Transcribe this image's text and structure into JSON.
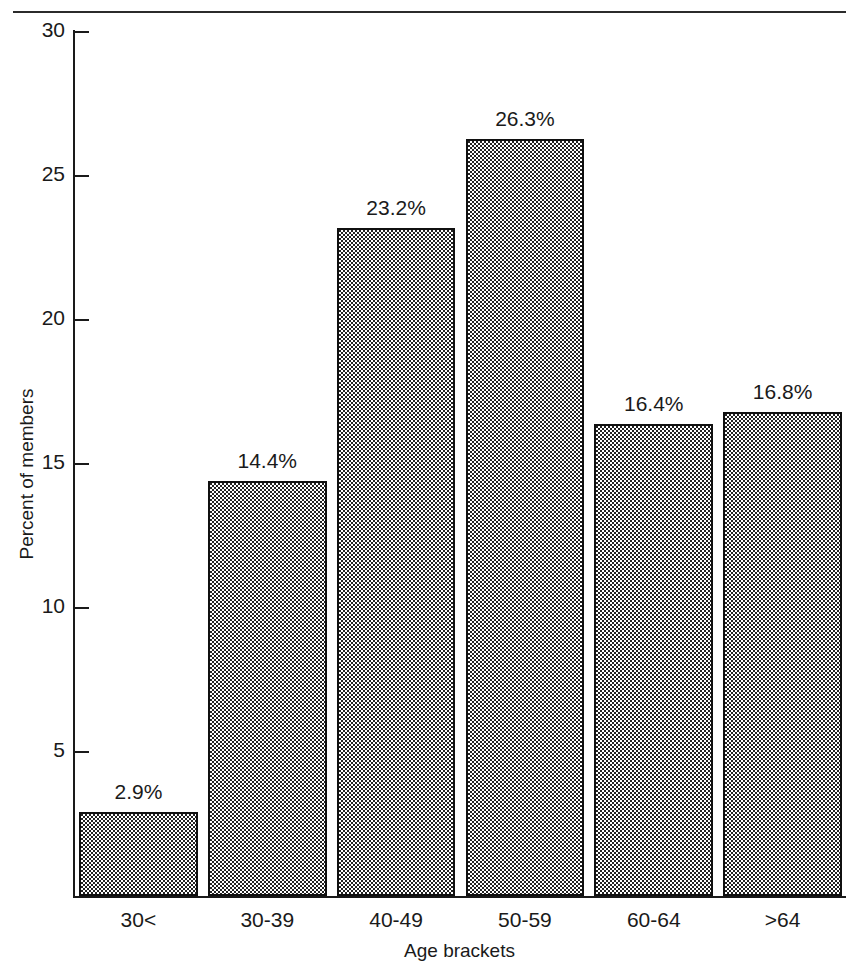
{
  "page": {
    "clipped_caption_above_rule": "",
    "background_color": "#ffffff",
    "ink_color": "#1a1a1a"
  },
  "chart_data": {
    "type": "bar",
    "title": "",
    "xlabel": "Age brackets",
    "ylabel": "Percent of members",
    "categories": [
      "30<",
      "30-39",
      "40-49",
      "50-59",
      "60-64",
      ">64"
    ],
    "values": [
      2.9,
      14.4,
      23.2,
      26.3,
      16.4,
      16.8
    ],
    "value_labels": [
      "2.9%",
      "14.4%",
      "23.2%",
      "26.3%",
      "16.4%",
      "16.8%"
    ],
    "ylim": [
      0,
      30
    ],
    "ytick_values": [
      5,
      10,
      15,
      20,
      25,
      30
    ],
    "ytick_labels": [
      "5",
      "10",
      "15",
      "20",
      "25",
      "30"
    ],
    "grid": false,
    "legend": null,
    "bar_fill": "stipple-dot-pattern",
    "bar_edge_color": "#101010"
  }
}
